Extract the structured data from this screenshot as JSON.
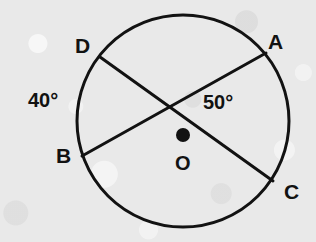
{
  "figure": {
    "kind": "circle-with-two-intersecting-chords",
    "background_color": "#e9e9e9",
    "stroke_color": "#121212",
    "circle": {
      "cx": 183,
      "cy": 121,
      "r": 106,
      "stroke_width": 3
    },
    "chords": [
      {
        "name": "chord-DC",
        "from": "D",
        "to": "C",
        "x1": 100,
        "y1": 57,
        "x2": 273,
        "y2": 181
      },
      {
        "name": "chord-AB",
        "from": "A",
        "to": "B",
        "x1": 266,
        "y1": 53,
        "x2": 82,
        "y2": 156
      }
    ],
    "center_dot": {
      "cx": 183,
      "cy": 135,
      "r": 7
    },
    "intersection": {
      "x": 172,
      "y": 104
    }
  },
  "labels": {
    "point_a": {
      "text": "A",
      "x": 268,
      "y": 31
    },
    "point_b": {
      "text": "B",
      "x": 56,
      "y": 145
    },
    "point_c": {
      "text": "C",
      "x": 284,
      "y": 181
    },
    "point_d": {
      "text": "D",
      "x": 75,
      "y": 35
    },
    "center_o": {
      "text": "O",
      "x": 175,
      "y": 153
    },
    "angle_left": {
      "text": "40°",
      "x": 28,
      "y": 90
    },
    "angle_right": {
      "text": "50°",
      "x": 203,
      "y": 92
    }
  }
}
